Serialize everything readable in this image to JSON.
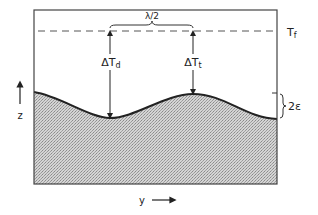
{
  "diagram": {
    "labels": {
      "freezing_temp": "T",
      "freezing_temp_sub": "f",
      "half_wavelength": "λ/2",
      "delta_trough": "ΔT",
      "delta_trough_sub": "d",
      "delta_tip": "ΔT",
      "delta_tip_sub": "t",
      "amplitude": "2ε",
      "z_axis": "z",
      "y_axis": "y"
    },
    "colors": {
      "line": "#222222",
      "fill": "#b8b8b8",
      "dash": "#555555"
    }
  }
}
